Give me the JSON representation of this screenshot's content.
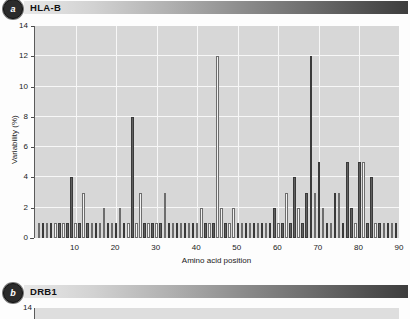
{
  "panels": [
    {
      "badge": "a",
      "title": "HLA-B"
    },
    {
      "badge": "b",
      "title": "DRB1"
    }
  ],
  "chart_data": {
    "type": "bar",
    "title": "HLA-B",
    "xlabel": "Amino acid position",
    "ylabel": "Variability (%)",
    "xlim": [
      0,
      90
    ],
    "ylim": [
      0,
      14
    ],
    "yticks": [
      0,
      2,
      4,
      6,
      8,
      10,
      12,
      14
    ],
    "xticks": [
      10,
      20,
      30,
      40,
      50,
      60,
      70,
      80,
      90
    ],
    "grid": true,
    "legend": "none",
    "series": [
      {
        "name": "variability",
        "points": [
          {
            "x": 1,
            "v": 1,
            "fill": "light"
          },
          {
            "x": 2,
            "v": 1,
            "fill": "dark"
          },
          {
            "x": 3,
            "v": 1,
            "fill": "light"
          },
          {
            "x": 4,
            "v": 1,
            "fill": "dark"
          },
          {
            "x": 5,
            "v": 1,
            "fill": "light"
          },
          {
            "x": 6,
            "v": 1,
            "fill": "dark"
          },
          {
            "x": 7,
            "v": 1,
            "fill": "light"
          },
          {
            "x": 8,
            "v": 1,
            "fill": "dark"
          },
          {
            "x": 9,
            "v": 4,
            "fill": "dark"
          },
          {
            "x": 10,
            "v": 1,
            "fill": "light"
          },
          {
            "x": 11,
            "v": 1,
            "fill": "dark"
          },
          {
            "x": 12,
            "v": 3,
            "fill": "light"
          },
          {
            "x": 13,
            "v": 1,
            "fill": "dark"
          },
          {
            "x": 14,
            "v": 1,
            "fill": "light"
          },
          {
            "x": 15,
            "v": 1,
            "fill": "dark"
          },
          {
            "x": 16,
            "v": 1,
            "fill": "light"
          },
          {
            "x": 17,
            "v": 2,
            "fill": "light"
          },
          {
            "x": 18,
            "v": 1,
            "fill": "dark"
          },
          {
            "x": 19,
            "v": 1,
            "fill": "light"
          },
          {
            "x": 20,
            "v": 1,
            "fill": "dark"
          },
          {
            "x": 21,
            "v": 2,
            "fill": "light"
          },
          {
            "x": 22,
            "v": 1,
            "fill": "dark"
          },
          {
            "x": 23,
            "v": 1,
            "fill": "light"
          },
          {
            "x": 24,
            "v": 8,
            "fill": "dark"
          },
          {
            "x": 25,
            "v": 1,
            "fill": "light"
          },
          {
            "x": 26,
            "v": 3,
            "fill": "light"
          },
          {
            "x": 27,
            "v": 1,
            "fill": "dark"
          },
          {
            "x": 28,
            "v": 1,
            "fill": "light"
          },
          {
            "x": 29,
            "v": 1,
            "fill": "dark"
          },
          {
            "x": 30,
            "v": 1,
            "fill": "light"
          },
          {
            "x": 31,
            "v": 1,
            "fill": "dark"
          },
          {
            "x": 32,
            "v": 3,
            "fill": "light"
          },
          {
            "x": 33,
            "v": 1,
            "fill": "dark"
          },
          {
            "x": 34,
            "v": 1,
            "fill": "light"
          },
          {
            "x": 35,
            "v": 1,
            "fill": "dark"
          },
          {
            "x": 36,
            "v": 1,
            "fill": "light"
          },
          {
            "x": 37,
            "v": 1,
            "fill": "dark"
          },
          {
            "x": 38,
            "v": 1,
            "fill": "light"
          },
          {
            "x": 39,
            "v": 1,
            "fill": "dark"
          },
          {
            "x": 40,
            "v": 1,
            "fill": "light"
          },
          {
            "x": 41,
            "v": 2,
            "fill": "light"
          },
          {
            "x": 42,
            "v": 1,
            "fill": "dark"
          },
          {
            "x": 43,
            "v": 1,
            "fill": "light"
          },
          {
            "x": 44,
            "v": 1,
            "fill": "dark"
          },
          {
            "x": 45,
            "v": 12,
            "fill": "light"
          },
          {
            "x": 46,
            "v": 2,
            "fill": "light"
          },
          {
            "x": 47,
            "v": 1,
            "fill": "dark"
          },
          {
            "x": 48,
            "v": 1,
            "fill": "light"
          },
          {
            "x": 49,
            "v": 2,
            "fill": "light"
          },
          {
            "x": 50,
            "v": 1,
            "fill": "dark"
          },
          {
            "x": 51,
            "v": 1,
            "fill": "light"
          },
          {
            "x": 52,
            "v": 1,
            "fill": "dark"
          },
          {
            "x": 53,
            "v": 1,
            "fill": "light"
          },
          {
            "x": 54,
            "v": 1,
            "fill": "dark"
          },
          {
            "x": 55,
            "v": 1,
            "fill": "light"
          },
          {
            "x": 56,
            "v": 1,
            "fill": "dark"
          },
          {
            "x": 57,
            "v": 1,
            "fill": "light"
          },
          {
            "x": 58,
            "v": 1,
            "fill": "dark"
          },
          {
            "x": 59,
            "v": 2,
            "fill": "dark"
          },
          {
            "x": 60,
            "v": 1,
            "fill": "light"
          },
          {
            "x": 61,
            "v": 1,
            "fill": "dark"
          },
          {
            "x": 62,
            "v": 3,
            "fill": "light"
          },
          {
            "x": 63,
            "v": 1,
            "fill": "dark"
          },
          {
            "x": 64,
            "v": 4,
            "fill": "dark"
          },
          {
            "x": 65,
            "v": 2,
            "fill": "light"
          },
          {
            "x": 66,
            "v": 1,
            "fill": "dark"
          },
          {
            "x": 67,
            "v": 3,
            "fill": "dark"
          },
          {
            "x": 68,
            "v": 12,
            "fill": "dark"
          },
          {
            "x": 69,
            "v": 3,
            "fill": "light"
          },
          {
            "x": 70,
            "v": 5,
            "fill": "dark"
          },
          {
            "x": 71,
            "v": 2,
            "fill": "light"
          },
          {
            "x": 72,
            "v": 1,
            "fill": "dark"
          },
          {
            "x": 73,
            "v": 1,
            "fill": "light"
          },
          {
            "x": 74,
            "v": 3,
            "fill": "dark"
          },
          {
            "x": 75,
            "v": 3,
            "fill": "light"
          },
          {
            "x": 76,
            "v": 1,
            "fill": "dark"
          },
          {
            "x": 77,
            "v": 5,
            "fill": "dark"
          },
          {
            "x": 78,
            "v": 2,
            "fill": "dark"
          },
          {
            "x": 79,
            "v": 1,
            "fill": "light"
          },
          {
            "x": 80,
            "v": 5,
            "fill": "dark"
          },
          {
            "x": 81,
            "v": 5,
            "fill": "light"
          },
          {
            "x": 82,
            "v": 1,
            "fill": "dark"
          },
          {
            "x": 83,
            "v": 4,
            "fill": "dark"
          },
          {
            "x": 84,
            "v": 1,
            "fill": "light"
          },
          {
            "x": 85,
            "v": 1,
            "fill": "dark"
          },
          {
            "x": 86,
            "v": 1,
            "fill": "light"
          },
          {
            "x": 87,
            "v": 1,
            "fill": "dark"
          },
          {
            "x": 88,
            "v": 1,
            "fill": "light"
          },
          {
            "x": 89,
            "v": 1,
            "fill": "dark"
          },
          {
            "x": 90,
            "v": 1,
            "fill": "light"
          }
        ]
      }
    ]
  },
  "chart_b": {
    "type": "bar",
    "title": "DRB1",
    "yticks": [
      14
    ]
  }
}
